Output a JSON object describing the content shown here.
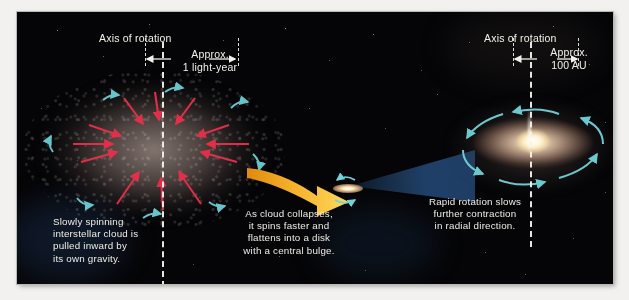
{
  "figure": {
    "domain": "astronomy-diagram",
    "background_color": "#050507",
    "page_color": "#f2f1ef"
  },
  "left_stage": {
    "axis_label": "Axis of rotation",
    "measure_label_line1": "Approx.",
    "measure_label_line2": "1 light-year",
    "caption_line1": "Slowly spinning",
    "caption_line2": "interstellar cloud is",
    "caption_line3": "pulled inward by",
    "caption_line4": "its own gravity.",
    "caption_full": "Slowly spinning interstellar cloud is pulled inward by its own gravity.",
    "cloud_name": "interstellar-cloud",
    "gravity_arrow_color": "#e8304a",
    "rotation_arrow_color": "#6fd4da",
    "gravity_arrow_count": 12,
    "rotation_arrow_count": 8
  },
  "transition": {
    "caption_line1": "As cloud collapses,",
    "caption_line2": "it spins faster and",
    "caption_line3": "flattens into a disk",
    "caption_line4": "with a central bulge.",
    "caption_full": "As cloud collapses, it spins faster and flattens into a disk with a central bulge.",
    "arrow_name": "yellow-transition-arrow",
    "arrow_color_start": "#f6b12a",
    "arrow_color_end": "#ffd85c",
    "cone_color": "#2a5c96"
  },
  "right_stage": {
    "axis_label": "Axis of rotation",
    "measure_label_line1": "Approx.",
    "measure_label_line2": "100 AU",
    "caption_line1": "Rapid rotation slows",
    "caption_line2": "further contraction",
    "caption_line3": "in radial direction.",
    "caption_full": "Rapid rotation slows further contraction in radial direction.",
    "disk_name": "protostellar-disk",
    "rotation_arrow_color": "#6fd4da",
    "rotation_arrow_count": 6,
    "core_color": "#fffdf3"
  }
}
